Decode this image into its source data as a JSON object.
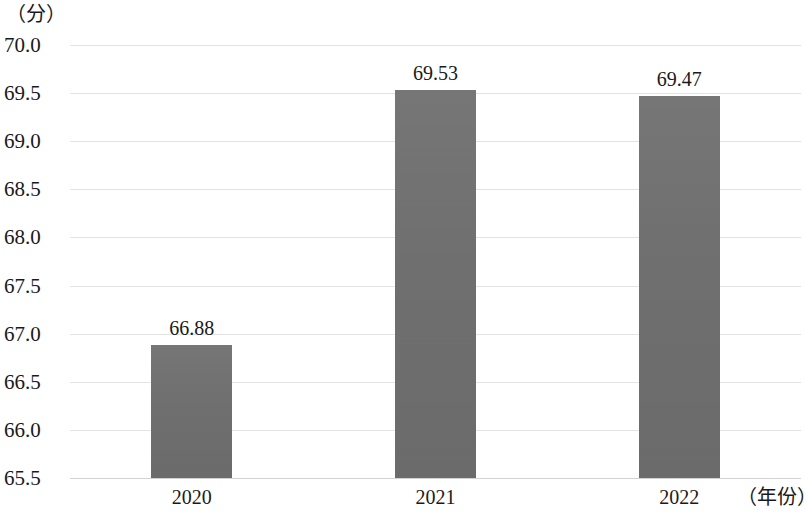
{
  "chart_data": {
    "type": "bar",
    "title": "",
    "subtitle": "",
    "categories": [
      "2020",
      "2021",
      "2022"
    ],
    "values": [
      66.88,
      69.53,
      69.47
    ],
    "value_labels": [
      "66.88",
      "69.53",
      "69.47"
    ],
    "xlabel": "（年份）",
    "ylabel": "（分）",
    "ylim": [
      65.5,
      70.0
    ],
    "y_tick_step": 0.5,
    "y_ticks": [
      70.0,
      69.5,
      69.0,
      68.5,
      68.0,
      67.5,
      67.0,
      66.5,
      66.0,
      65.5
    ],
    "y_tick_labels": [
      "70.0",
      "69.5",
      "69.0",
      "68.5",
      "68.0",
      "67.5",
      "67.0",
      "66.5",
      "66.0",
      "65.5"
    ],
    "grid": true,
    "grid_axis": "y",
    "legend": false,
    "legend_position": "none",
    "series": [
      {
        "name": "",
        "values": [
          66.88,
          69.53,
          69.47
        ]
      }
    ],
    "colors": {
      "bar_fill": "#6f6f6f",
      "gridline": "#e3e3e3",
      "baseline": "#d2d2d2",
      "text": "#1a1a1a",
      "background": "#ffffff"
    }
  },
  "axes": {
    "y_unit_caption": "（分）",
    "x_unit_caption": "（年份）"
  }
}
